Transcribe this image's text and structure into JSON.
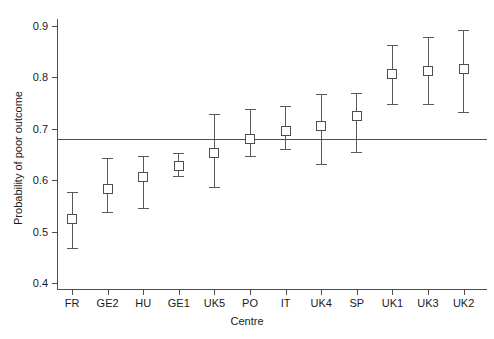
{
  "chart_data": {
    "type": "scatter",
    "title": "",
    "xlabel": "Centre",
    "ylabel": "Probability of poor outcome",
    "xlim_categories": [
      "FR",
      "GE2",
      "HU",
      "GE1",
      "UK5",
      "PO",
      "IT",
      "UK4",
      "SP",
      "UK1",
      "UK3",
      "UK2"
    ],
    "ylim": [
      0.4,
      0.9
    ],
    "ytick_labels": [
      "0.9",
      "0.8",
      "0.7",
      "0.6",
      "0.5",
      "0.4"
    ],
    "ytick_values": [
      0.9,
      0.8,
      0.7,
      0.6,
      0.5,
      0.4
    ],
    "grid": false,
    "legend": "none",
    "reference_line": {
      "label": "overall probability",
      "value": 0.68,
      "orientation": "horizontal"
    },
    "categories": [
      "FR",
      "GE2",
      "HU",
      "GE1",
      "UK5",
      "PO",
      "IT",
      "UK4",
      "SP",
      "UK1",
      "UK3",
      "UK2"
    ],
    "values": [
      0.524,
      0.583,
      0.606,
      0.627,
      0.653,
      0.681,
      0.695,
      0.705,
      0.724,
      0.806,
      0.812,
      0.816
    ],
    "ci_lower": [
      0.468,
      0.538,
      0.546,
      0.608,
      0.586,
      0.647,
      0.661,
      0.632,
      0.655,
      0.748,
      0.748,
      0.732
    ],
    "ci_upper": [
      0.577,
      0.643,
      0.647,
      0.653,
      0.728,
      0.738,
      0.744,
      0.768,
      0.77,
      0.864,
      0.878,
      0.892
    ],
    "marker": "open-square",
    "errorbar_style": "capped-whiskers",
    "points": [
      {
        "centre": "FR",
        "estimate": 0.524,
        "lower": 0.468,
        "upper": 0.577
      },
      {
        "centre": "GE2",
        "estimate": 0.583,
        "lower": 0.538,
        "upper": 0.643
      },
      {
        "centre": "HU",
        "estimate": 0.606,
        "lower": 0.546,
        "upper": 0.647
      },
      {
        "centre": "GE1",
        "estimate": 0.627,
        "lower": 0.608,
        "upper": 0.653
      },
      {
        "centre": "UK5",
        "estimate": 0.653,
        "lower": 0.586,
        "upper": 0.728
      },
      {
        "centre": "PO",
        "estimate": 0.681,
        "lower": 0.647,
        "upper": 0.738
      },
      {
        "centre": "IT",
        "estimate": 0.695,
        "lower": 0.661,
        "upper": 0.744
      },
      {
        "centre": "UK4",
        "estimate": 0.705,
        "lower": 0.632,
        "upper": 0.768
      },
      {
        "centre": "SP",
        "estimate": 0.724,
        "lower": 0.655,
        "upper": 0.77
      },
      {
        "centre": "UK1",
        "estimate": 0.806,
        "lower": 0.748,
        "upper": 0.864
      },
      {
        "centre": "UK3",
        "estimate": 0.812,
        "lower": 0.748,
        "upper": 0.878
      },
      {
        "centre": "UK2",
        "estimate": 0.816,
        "lower": 0.732,
        "upper": 0.892
      }
    ],
    "colors": {
      "axis": "#4d4d4d",
      "marker_edge": "#4d4d4d",
      "marker_face": "#ffffff",
      "errorbar": "#595959",
      "reference_line": "#4d4d4d",
      "text": "#1a1a1a",
      "background": "#ffffff"
    }
  }
}
